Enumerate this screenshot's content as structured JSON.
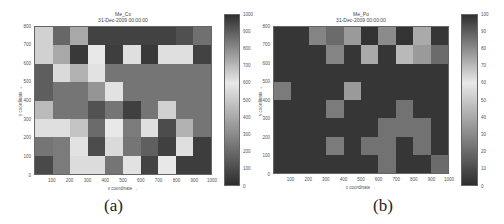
{
  "chart_data": [
    {
      "type": "heatmap",
      "title": "Me_Cs",
      "subtitle": "31-Dec-2009 00:00:00",
      "xlabel": "x coordinate →",
      "ylabel": "y coordinate →",
      "xlim": [
        0,
        1000
      ],
      "ylim": [
        0,
        800
      ],
      "x_ticks": [
        "100",
        "200",
        "300",
        "400",
        "500",
        "600",
        "700",
        "800",
        "900",
        "1000"
      ],
      "y_ticks": [
        "0",
        "100",
        "200",
        "300",
        "400",
        "500",
        "600",
        "700",
        "800"
      ],
      "colorbar": {
        "min": 0,
        "max": 1000,
        "ticks": [
          "0",
          "100",
          "200",
          "300",
          "400",
          "500",
          "600",
          "700",
          "800",
          "900",
          "1000"
        ]
      },
      "grid_cols": 10,
      "grid_rows": 8,
      "rows_top_to_bottom": [
        [
          650,
          880,
          740,
          960,
          960,
          960,
          960,
          960,
          930,
          860
        ],
        [
          650,
          740,
          980,
          600,
          970,
          620,
          980,
          620,
          620,
          960
        ],
        [
          900,
          630,
          720,
          580,
          850,
          850,
          850,
          850,
          850,
          850
        ],
        [
          900,
          850,
          850,
          780,
          580,
          850,
          850,
          850,
          850,
          850
        ],
        [
          700,
          850,
          850,
          120,
          850,
          60,
          850,
          650,
          850,
          850
        ],
        [
          620,
          620,
          680,
          200,
          600,
          250,
          620,
          100,
          720,
          850
        ],
        [
          230,
          250,
          580,
          100,
          630,
          230,
          160,
          60,
          620,
          50
        ],
        [
          90,
          250,
          560,
          560,
          230,
          580,
          70,
          600,
          50,
          50
        ]
      ],
      "caption": "(a)"
    },
    {
      "type": "heatmap",
      "title": "Me_Po",
      "subtitle": "31-Dec-2009 00:00:00",
      "xlabel": "x coordinate →",
      "ylabel": "y coordinate →",
      "xlim": [
        0,
        1000
      ],
      "ylim": [
        0,
        800
      ],
      "x_ticks": [
        "100",
        "200",
        "300",
        "400",
        "500",
        "600",
        "700",
        "800",
        "900",
        "1000"
      ],
      "y_ticks": [
        "0",
        "100",
        "200",
        "300",
        "400",
        "500",
        "600",
        "700",
        "800"
      ],
      "colorbar": {
        "min": 0,
        "max": 100,
        "ticks": [
          "0",
          "10",
          "20",
          "30",
          "40",
          "50",
          "60",
          "70",
          "80",
          "90",
          "100"
        ]
      },
      "grid_cols": 10,
      "grid_rows": 8,
      "rows_top_to_bottom": [
        [
          3,
          3,
          28,
          20,
          35,
          2,
          30,
          2,
          40,
          3
        ],
        [
          3,
          3,
          3,
          28,
          3,
          40,
          3,
          45,
          35,
          20
        ],
        [
          3,
          3,
          3,
          3,
          3,
          3,
          3,
          3,
          3,
          3
        ],
        [
          25,
          3,
          3,
          3,
          35,
          3,
          3,
          3,
          3,
          3
        ],
        [
          3,
          3,
          3,
          25,
          3,
          3,
          3,
          22,
          3,
          3
        ],
        [
          3,
          3,
          3,
          3,
          3,
          3,
          22,
          22,
          22,
          3
        ],
        [
          3,
          3,
          3,
          25,
          3,
          22,
          22,
          3,
          22,
          3
        ],
        [
          3,
          3,
          3,
          3,
          3,
          3,
          22,
          3,
          3,
          20
        ]
      ],
      "caption": "(b)"
    }
  ]
}
